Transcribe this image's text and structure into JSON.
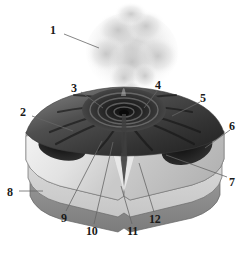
{
  "figure": {
    "name": "volcano-cross-section-diagram",
    "style": "grayscale-cutaway-block-diagram",
    "background_color": "#ffffff",
    "width": 250,
    "height": 253
  },
  "palette": {
    "background": "#ffffff",
    "plume_light": "#e8e8e8",
    "plume_mid": "#cfcfcf",
    "plume_dark": "#b4b4b4",
    "cone_dark": "#2b2b2b",
    "cone_mid": "#4d4d4d",
    "cone_light": "#6f6f6f",
    "crater_black": "#151515",
    "strata_top": "#9a9a9a",
    "strata_light": "#d4d4d4",
    "strata_mid": "#b0b0b0",
    "strata_base": "#8a8a8a",
    "cut_face_light": "#efefef",
    "cut_face_mid": "#c8c8c8",
    "magma_dark": "#1e1e1e",
    "outline": "#555555",
    "leader_line": "#666666",
    "label_text": "#1a1a1a"
  },
  "labels": [
    {
      "id": "1",
      "text": "1",
      "x": 50,
      "y": 24,
      "leader": {
        "x1": 64,
        "y1": 34,
        "x2": 99,
        "y2": 48
      }
    },
    {
      "id": "2",
      "text": "2",
      "x": 20,
      "y": 106,
      "leader": {
        "x1": 32,
        "y1": 116,
        "x2": 73,
        "y2": 131
      }
    },
    {
      "id": "3",
      "text": "3",
      "x": 71,
      "y": 82,
      "leader": {
        "x1": 81,
        "y1": 92,
        "x2": 103,
        "y2": 108
      }
    },
    {
      "id": "4",
      "text": "4",
      "x": 155,
      "y": 79,
      "leader": {
        "x1": 158,
        "y1": 90,
        "x2": 144,
        "y2": 108
      }
    },
    {
      "id": "5",
      "text": "5",
      "x": 200,
      "y": 92,
      "leader": {
        "x1": 200,
        "y1": 102,
        "x2": 172,
        "y2": 116
      }
    },
    {
      "id": "6",
      "text": "6",
      "x": 229,
      "y": 120,
      "leader": {
        "x1": 230,
        "y1": 130,
        "x2": 205,
        "y2": 148
      }
    },
    {
      "id": "7",
      "text": "7",
      "x": 229,
      "y": 176,
      "leader": {
        "x1": 227,
        "y1": 177,
        "x2": 166,
        "y2": 155
      }
    },
    {
      "id": "8",
      "text": "8",
      "x": 7,
      "y": 186,
      "leader": {
        "x1": 19,
        "y1": 191,
        "x2": 43,
        "y2": 191
      }
    },
    {
      "id": "9",
      "text": "9",
      "x": 61,
      "y": 212,
      "leader": {
        "x1": 66,
        "y1": 211,
        "x2": 102,
        "y2": 141
      }
    },
    {
      "id": "10",
      "text": "10",
      "x": 86,
      "y": 225,
      "leader": {
        "x1": 94,
        "y1": 224,
        "x2": 113,
        "y2": 142
      }
    },
    {
      "id": "11",
      "text": "11",
      "x": 127,
      "y": 225,
      "leader": {
        "x1": 132,
        "y1": 224,
        "x2": 121,
        "y2": 186
      }
    },
    {
      "id": "12",
      "text": "12",
      "x": 149,
      "y": 213,
      "leader": {
        "x1": 154,
        "y1": 212,
        "x2": 139,
        "y2": 163
      }
    }
  ]
}
